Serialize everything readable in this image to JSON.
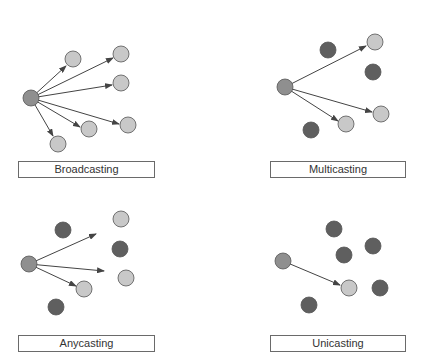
{
  "colors": {
    "source": "#8f8f8f",
    "receiver": "#c8c8c8",
    "non_member": "#5f5f5f",
    "stroke": "#555555",
    "arrow": "#444444"
  },
  "panels": [
    {
      "id": "broadcasting",
      "label": "Broadcasting",
      "box": {
        "x": 18,
        "y": 161,
        "w": 137
      },
      "source": [
        31,
        98
      ],
      "receivers": [
        [
          73,
          59
        ],
        [
          121,
          54
        ],
        [
          121,
          83
        ],
        [
          128,
          125
        ],
        [
          89,
          129
        ],
        [
          58,
          144
        ]
      ],
      "non_members": [],
      "arrows": [
        [
          66,
          66
        ],
        [
          113,
          58
        ],
        [
          112,
          85
        ],
        [
          119,
          124
        ],
        [
          80,
          127
        ],
        [
          53,
          136
        ]
      ]
    },
    {
      "id": "multicasting",
      "label": "Multicasting",
      "box": {
        "x": 270,
        "y": 161,
        "w": 136
      },
      "source": [
        285,
        87
      ],
      "receivers": [
        [
          375,
          42
        ],
        [
          381,
          114
        ],
        [
          346,
          124
        ]
      ],
      "non_members": [
        [
          328,
          50
        ],
        [
          373,
          72
        ],
        [
          311,
          130
        ]
      ],
      "arrows": [
        [
          366,
          46
        ],
        [
          372,
          112
        ],
        [
          338,
          121
        ]
      ]
    },
    {
      "id": "anycasting",
      "label": "Anycasting",
      "box": {
        "x": 18,
        "y": 335,
        "w": 137
      },
      "source": [
        29,
        264
      ],
      "receivers": [
        [
          121,
          219
        ],
        [
          126,
          278
        ],
        [
          84,
          289
        ]
      ],
      "non_members": [
        [
          63,
          230
        ],
        [
          120,
          249
        ],
        [
          56,
          307
        ]
      ],
      "arrows": [
        [
          96,
          234
        ],
        [
          104,
          271
        ],
        [
          76,
          286
        ]
      ]
    },
    {
      "id": "unicasting",
      "label": "Unicasting",
      "box": {
        "x": 270,
        "y": 335,
        "w": 136
      },
      "source": [
        283,
        261
      ],
      "receivers": [
        [
          349,
          288
        ]
      ],
      "non_members": [
        [
          334,
          229
        ],
        [
          373,
          246
        ],
        [
          344,
          255
        ],
        [
          380,
          288
        ],
        [
          309,
          305
        ]
      ],
      "arrows": [
        [
          340,
          285
        ]
      ]
    }
  ],
  "node_radius": 8
}
